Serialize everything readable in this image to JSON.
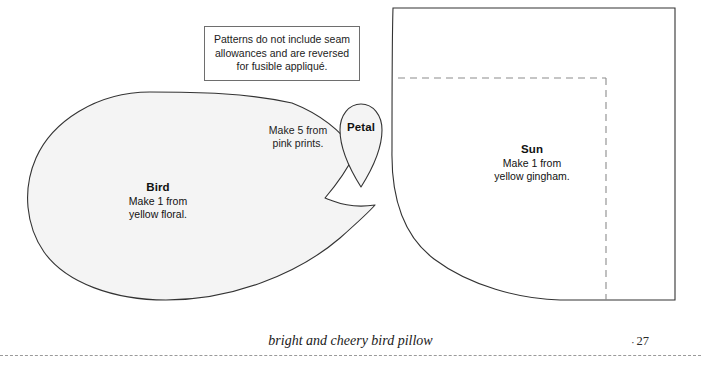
{
  "page": {
    "width": 701,
    "height": 370,
    "background": "#ffffff",
    "paper_fill": "#f4f4f4",
    "outline_color": "#333333",
    "dashed_color": "#8c8c8c"
  },
  "note": {
    "text": "Patterns do not include seam\nallowances and are reversed\nfor fusible appliqué."
  },
  "pieces": {
    "bird": {
      "title": "Bird",
      "sub": "Make 1 from\nyellow floral."
    },
    "petal": {
      "title": "Petal",
      "callout": "Make 5 from\npink prints."
    },
    "sun": {
      "title": "Sun",
      "sub": "Make 1 from\nyellow gingham."
    }
  },
  "footer": {
    "project_title": "bright and cheery bird pillow",
    "page_dot": "·",
    "page_number": "27"
  }
}
